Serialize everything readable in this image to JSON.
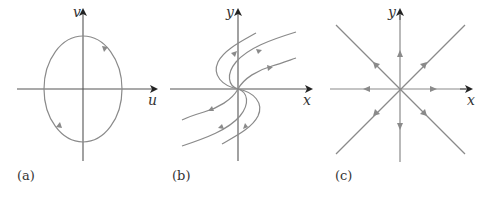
{
  "figure": {
    "panels": [
      {
        "id": "a",
        "label": "(a)",
        "x_axis_label": "u",
        "y_axis_label": "v",
        "description": "closed elliptical orbit (center), counterclockwise flow"
      },
      {
        "id": "b",
        "label": "(b)",
        "x_axis_label": "x",
        "y_axis_label": "y",
        "description": "degenerate node, trajectories leaving origin"
      },
      {
        "id": "c",
        "label": "(c)",
        "x_axis_label": "x",
        "y_axis_label": "y",
        "description": "star node (source), straight-line trajectories radiating outward"
      }
    ],
    "colors": {
      "axis": "#555555",
      "trajectory": "#8a8a8a",
      "text": "#333333"
    }
  }
}
